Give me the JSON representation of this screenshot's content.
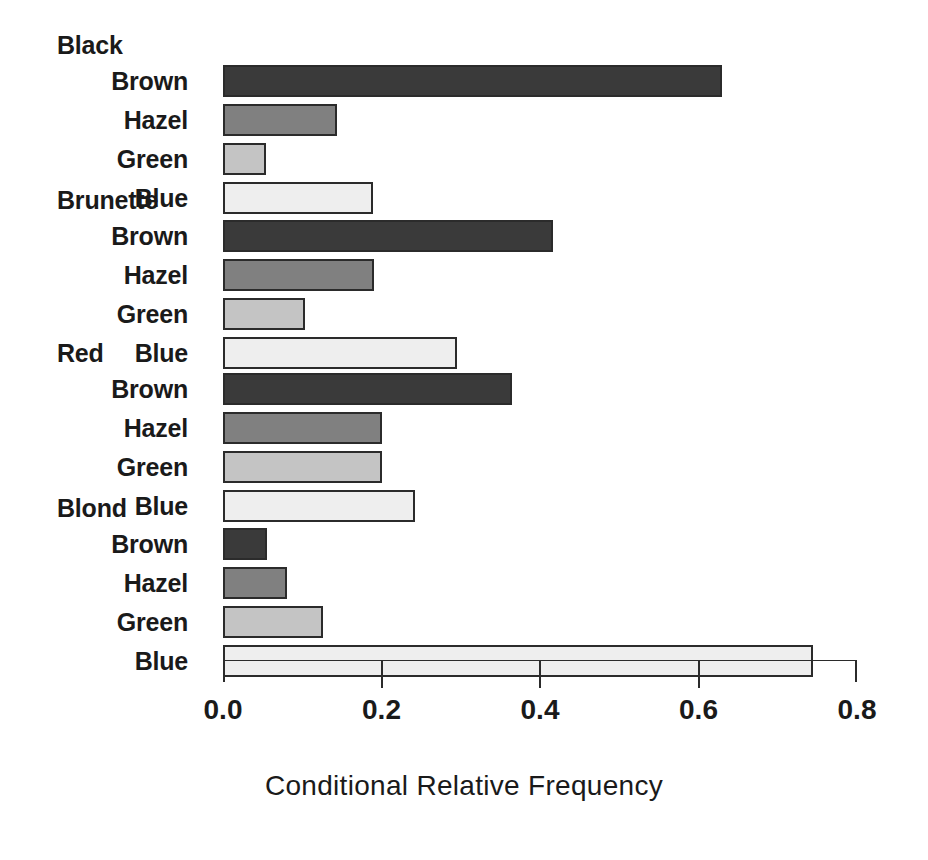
{
  "chart_data": {
    "type": "bar",
    "orientation": "horizontal",
    "title": "",
    "xlabel": "Conditional Relative Frequency",
    "ylabel": "",
    "xlim": [
      0.0,
      0.8
    ],
    "xticks": [
      0.0,
      0.2,
      0.4,
      0.6,
      0.8
    ],
    "xtick_labels": [
      "0.0",
      "0.2",
      "0.4",
      "0.6",
      "0.8"
    ],
    "grid": false,
    "legend": "none",
    "group_label": "Hair Color",
    "category_label": "Eye Color",
    "categories": [
      "Brown",
      "Hazel",
      "Green",
      "Blue"
    ],
    "groups": [
      {
        "name": "Black",
        "bars": [
          {
            "label": "Brown",
            "value": 0.63,
            "color": "#3a3a3a"
          },
          {
            "label": "Hazel",
            "value": 0.144,
            "color": "#808080"
          },
          {
            "label": "Green",
            "value": 0.054,
            "color": "#c4c4c4"
          },
          {
            "label": "Blue",
            "value": 0.189,
            "color": "#eeeeee"
          }
        ]
      },
      {
        "name": "Brunette",
        "bars": [
          {
            "label": "Brown",
            "value": 0.416,
            "color": "#3a3a3a"
          },
          {
            "label": "Hazel",
            "value": 0.191,
            "color": "#808080"
          },
          {
            "label": "Green",
            "value": 0.103,
            "color": "#c4c4c4"
          },
          {
            "label": "Blue",
            "value": 0.295,
            "color": "#eeeeee"
          }
        ]
      },
      {
        "name": "Red",
        "bars": [
          {
            "label": "Brown",
            "value": 0.365,
            "color": "#3a3a3a"
          },
          {
            "label": "Hazel",
            "value": 0.2,
            "color": "#808080"
          },
          {
            "label": "Green",
            "value": 0.2,
            "color": "#c4c4c4"
          },
          {
            "label": "Blue",
            "value": 0.242,
            "color": "#eeeeee"
          }
        ]
      },
      {
        "name": "Blond",
        "bars": [
          {
            "label": "Brown",
            "value": 0.055,
            "color": "#3a3a3a"
          },
          {
            "label": "Hazel",
            "value": 0.081,
            "color": "#808080"
          },
          {
            "label": "Green",
            "value": 0.126,
            "color": "#c4c4c4"
          },
          {
            "label": "Blue",
            "value": 0.744,
            "color": "#eeeeee"
          }
        ]
      }
    ]
  },
  "axis": {
    "title": "Conditional Relative Frequency",
    "tick_labels": [
      "0.0",
      "0.2",
      "0.4",
      "0.6",
      "0.8"
    ]
  },
  "style": {
    "bar_border_color": "#2b2b2b",
    "axis_color": "#2b2b2b",
    "text_color": "#1a1a1a",
    "background": "#ffffff"
  }
}
